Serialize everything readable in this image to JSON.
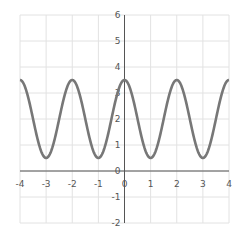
{
  "chart_data": {
    "type": "line",
    "title": "",
    "xlabel": "",
    "ylabel": "",
    "xlim": [
      -4,
      4
    ],
    "ylim": [
      -2,
      6
    ],
    "grid": true,
    "legend": null,
    "x_ticks": [
      -4,
      -3,
      -2,
      -1,
      0,
      1,
      2,
      3,
      4
    ],
    "y_ticks": [
      -2,
      -1,
      0,
      1,
      2,
      3,
      4,
      5,
      6
    ],
    "series": [
      {
        "name": "y = 2 + 1.5 cos(pi x)",
        "color": "#777777",
        "x": [
          -4,
          -3.5,
          -3,
          -2.5,
          -2,
          -1.5,
          -1,
          -0.5,
          0,
          0.5,
          1,
          1.5,
          2,
          2.5,
          3,
          3.5,
          4
        ],
        "values": [
          3.5,
          2,
          0.5,
          2,
          3.5,
          2,
          0.5,
          2,
          3.5,
          2,
          0.5,
          2,
          3.5,
          2,
          0.5,
          2,
          3.5
        ]
      }
    ]
  },
  "colors": {
    "grid": "#e2e2e2",
    "axis": "#555555",
    "line": "#777777"
  }
}
